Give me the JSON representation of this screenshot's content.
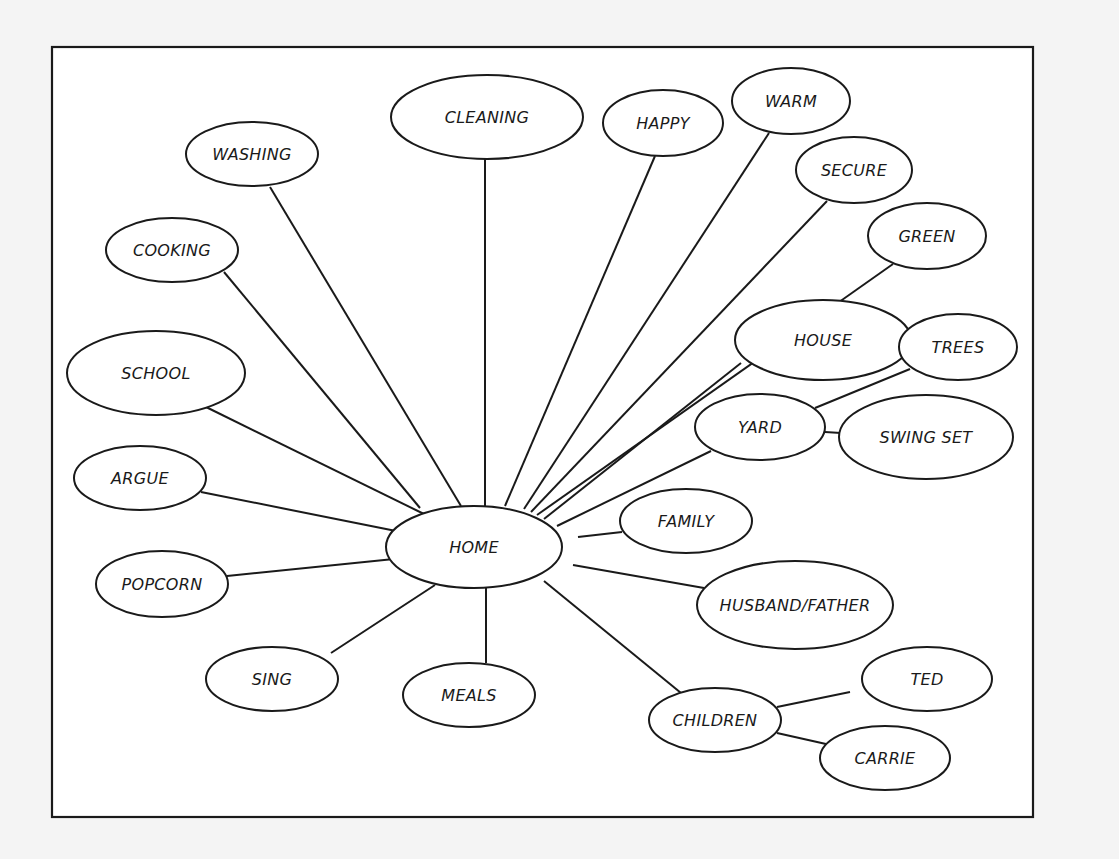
{
  "diagram": {
    "type": "concept-map",
    "center_node": "home",
    "frame": {
      "x": 52,
      "y": 47,
      "width": 981,
      "height": 770
    },
    "colors": {
      "stroke": "#1a1a1a",
      "fill": "#ffffff",
      "page": "#f4f4f4"
    },
    "nodes": [
      {
        "id": "cleaning",
        "label": "CLEANING",
        "cx": 487,
        "cy": 117,
        "rx": 96,
        "ry": 42
      },
      {
        "id": "washing",
        "label": "WASHING",
        "cx": 252,
        "cy": 154,
        "rx": 66,
        "ry": 32
      },
      {
        "id": "cooking",
        "label": "COOKING",
        "cx": 172,
        "cy": 250,
        "rx": 66,
        "ry": 32
      },
      {
        "id": "happy",
        "label": "HAPPY",
        "cx": 663,
        "cy": 123,
        "rx": 60,
        "ry": 33
      },
      {
        "id": "warm",
        "label": "WARM",
        "cx": 791,
        "cy": 101,
        "rx": 59,
        "ry": 33
      },
      {
        "id": "secure",
        "label": "SECURE",
        "cx": 854,
        "cy": 170,
        "rx": 58,
        "ry": 33
      },
      {
        "id": "green",
        "label": "GREEN",
        "cx": 927,
        "cy": 236,
        "rx": 59,
        "ry": 33
      },
      {
        "id": "house",
        "label": "HOUSE",
        "cx": 823,
        "cy": 340,
        "rx": 88,
        "ry": 40
      },
      {
        "id": "trees",
        "label": "TREES",
        "cx": 958,
        "cy": 347,
        "rx": 59,
        "ry": 33
      },
      {
        "id": "yard",
        "label": "YARD",
        "cx": 760,
        "cy": 427,
        "rx": 65,
        "ry": 33
      },
      {
        "id": "swing_set",
        "label": "SWING SET",
        "cx": 926,
        "cy": 437,
        "rx": 87,
        "ry": 42
      },
      {
        "id": "school",
        "label": "SCHOOL",
        "cx": 156,
        "cy": 373,
        "rx": 89,
        "ry": 42
      },
      {
        "id": "argue",
        "label": "ARGUE",
        "cx": 140,
        "cy": 478,
        "rx": 66,
        "ry": 32
      },
      {
        "id": "home",
        "label": "HOME",
        "cx": 474,
        "cy": 547,
        "rx": 88,
        "ry": 41
      },
      {
        "id": "family",
        "label": "FAMILY",
        "cx": 686,
        "cy": 521,
        "rx": 66,
        "ry": 32
      },
      {
        "id": "popcorn",
        "label": "POPCORN",
        "cx": 162,
        "cy": 584,
        "rx": 66,
        "ry": 33
      },
      {
        "id": "husband_father",
        "label": "HUSBAND/FATHER",
        "cx": 795,
        "cy": 605,
        "rx": 98,
        "ry": 44
      },
      {
        "id": "sing",
        "label": "SING",
        "cx": 272,
        "cy": 679,
        "rx": 66,
        "ry": 32
      },
      {
        "id": "meals",
        "label": "MEALS",
        "cx": 469,
        "cy": 695,
        "rx": 66,
        "ry": 32
      },
      {
        "id": "children",
        "label": "CHILDREN",
        "cx": 715,
        "cy": 720,
        "rx": 66,
        "ry": 32
      },
      {
        "id": "ted",
        "label": "TED",
        "cx": 927,
        "cy": 679,
        "rx": 65,
        "ry": 32
      },
      {
        "id": "carrie",
        "label": "CARRIE",
        "cx": 885,
        "cy": 758,
        "rx": 65,
        "ry": 32
      }
    ],
    "edges": [
      {
        "from": "home",
        "to": "cooking",
        "x1": 420,
        "y1": 508,
        "x2": 224,
        "y2": 272
      },
      {
        "from": "home",
        "to": "washing",
        "x1": 461,
        "y1": 506,
        "x2": 270,
        "y2": 187
      },
      {
        "from": "home",
        "to": "cleaning",
        "x1": 485,
        "y1": 506,
        "x2": 485,
        "y2": 159
      },
      {
        "from": "home",
        "to": "happy",
        "x1": 505,
        "y1": 506,
        "x2": 655,
        "y2": 156
      },
      {
        "from": "home",
        "to": "warm",
        "x1": 524,
        "y1": 509,
        "x2": 769,
        "y2": 133
      },
      {
        "from": "home",
        "to": "secure",
        "x1": 531,
        "y1": 512,
        "x2": 827,
        "y2": 201
      },
      {
        "from": "home",
        "to": "green",
        "x1": 537,
        "y1": 515,
        "x2": 893,
        "y2": 264
      },
      {
        "from": "home",
        "to": "house",
        "x1": 544,
        "y1": 519,
        "x2": 741,
        "y2": 363
      },
      {
        "from": "home",
        "to": "yard",
        "x1": 557,
        "y1": 526,
        "x2": 711,
        "y2": 451
      },
      {
        "from": "home",
        "to": "school",
        "x1": 424,
        "y1": 514,
        "x2": 206,
        "y2": 407
      },
      {
        "from": "home",
        "to": "argue",
        "x1": 396,
        "y1": 531,
        "x2": 201,
        "y2": 492
      },
      {
        "from": "home",
        "to": "popcorn",
        "x1": 394,
        "y1": 559,
        "x2": 227,
        "y2": 576
      },
      {
        "from": "home",
        "to": "sing",
        "x1": 435,
        "y1": 585,
        "x2": 331,
        "y2": 653
      },
      {
        "from": "home",
        "to": "meals",
        "x1": 486,
        "y1": 588,
        "x2": 486,
        "y2": 663
      },
      {
        "from": "home",
        "to": "family",
        "x1": 578,
        "y1": 537,
        "x2": 622,
        "y2": 532
      },
      {
        "from": "home",
        "to": "husband_father",
        "x1": 573,
        "y1": 565,
        "x2": 704,
        "y2": 588
      },
      {
        "from": "home",
        "to": "children",
        "x1": 544,
        "y1": 581,
        "x2": 681,
        "y2": 693
      },
      {
        "from": "yard",
        "to": "trees",
        "x1": 815,
        "y1": 408,
        "x2": 910,
        "y2": 369
      },
      {
        "from": "yard",
        "to": "swing_set",
        "x1": 825,
        "y1": 432,
        "x2": 841,
        "y2": 433
      },
      {
        "from": "children",
        "to": "ted",
        "x1": 777,
        "y1": 707,
        "x2": 850,
        "y2": 692
      },
      {
        "from": "children",
        "to": "carrie",
        "x1": 777,
        "y1": 733,
        "x2": 826,
        "y2": 744
      }
    ]
  }
}
